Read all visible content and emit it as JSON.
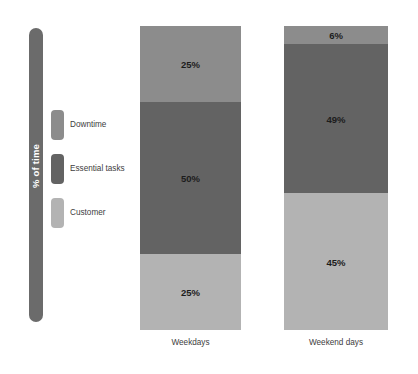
{
  "chart_data": {
    "type": "bar",
    "subtype": "stacked-100-percent",
    "title": "",
    "xlabel": "",
    "ylabel": "% of time",
    "ylim": [
      0,
      100
    ],
    "grid": false,
    "legend_position": "left",
    "stack_order_top_to_bottom": [
      "Downtime",
      "Essential tasks",
      "Customer"
    ],
    "categories": [
      "Weekdays",
      "Weekend days"
    ],
    "series": [
      {
        "name": "Downtime",
        "color": "#8c8c8c",
        "values": [
          25,
          6
        ],
        "labels": [
          "25%",
          "6%"
        ]
      },
      {
        "name": "Essential tasks",
        "color": "#636363",
        "values": [
          50,
          49
        ],
        "labels": [
          "50%",
          "49%"
        ]
      },
      {
        "name": "Customer",
        "color": "#b3b3b3",
        "values": [
          25,
          45
        ],
        "labels": [
          "25%",
          "45%"
        ]
      }
    ]
  },
  "axis": {
    "y_label": "% of time",
    "y_bar_color": "#6b6b6b",
    "y_label_color": "#ffffff"
  },
  "legend": {
    "items": [
      {
        "label": "Downtime",
        "color": "#8c8c8c"
      },
      {
        "label": "Essential tasks",
        "color": "#636363"
      },
      {
        "label": "Customer",
        "color": "#b3b3b3"
      }
    ]
  },
  "bars": [
    {
      "category": "Weekdays",
      "segments": [
        {
          "series": "Downtime",
          "value": 25,
          "label": "25%",
          "color": "#8c8c8c"
        },
        {
          "series": "Essential tasks",
          "value": 50,
          "label": "50%",
          "color": "#636363"
        },
        {
          "series": "Customer",
          "value": 25,
          "label": "25%",
          "color": "#b3b3b3"
        }
      ]
    },
    {
      "category": "Weekend days",
      "segments": [
        {
          "series": "Downtime",
          "value": 6,
          "label": "6%",
          "color": "#8c8c8c"
        },
        {
          "series": "Essential tasks",
          "value": 49,
          "label": "49%",
          "color": "#636363"
        },
        {
          "series": "Customer",
          "value": 45,
          "label": "45%",
          "color": "#b3b3b3"
        }
      ]
    }
  ]
}
